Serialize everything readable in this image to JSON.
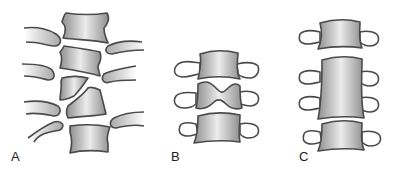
{
  "figure": {
    "panels": [
      {
        "label": "A",
        "description": "Lateral view of spine segment with wedge-shaped vertebrae (hemivertebrae) between normal vertebral bodies"
      },
      {
        "label": "B",
        "description": "Three vertebrae, middle one butterfly-shaped"
      },
      {
        "label": "C",
        "description": "Three vertebrae, middle two fused into one tall block vertebra"
      }
    ]
  },
  "colors": {
    "stroke": "#4a4a4a",
    "body_light": "#e8e8e8",
    "body_dark": "#9a9a9a",
    "process_fill": "#ffffff",
    "background": "#ffffff"
  }
}
